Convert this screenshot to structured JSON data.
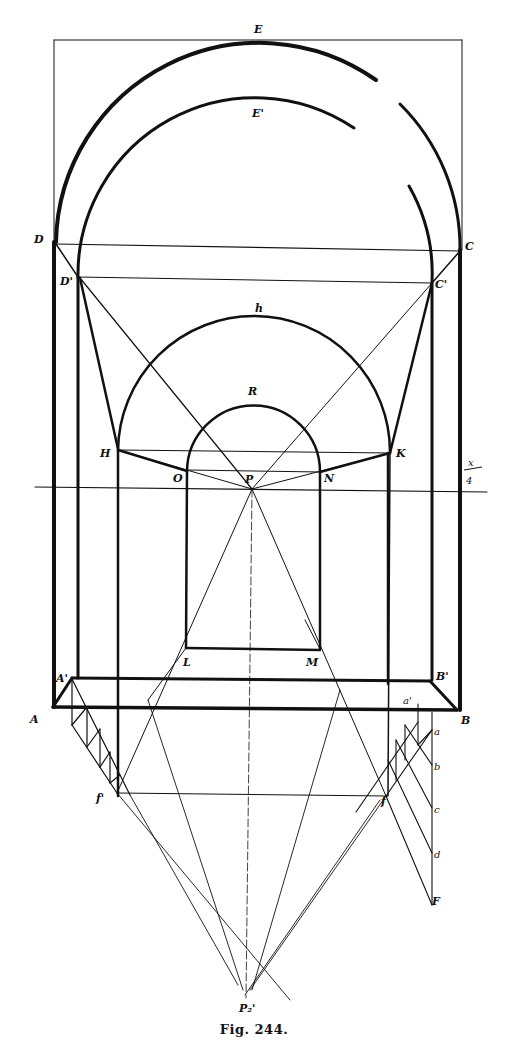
{
  "figure": {
    "caption": "Fig. 244.",
    "stroke_color": "#111111",
    "background": "#ffffff"
  },
  "labels": {
    "E": "E",
    "E_prime": "E'",
    "D": "D",
    "C": "C",
    "D_prime": "D'",
    "C_prime": "C'",
    "h": "h",
    "R": "R",
    "H": "H",
    "K": "K",
    "O": "O",
    "N": "N",
    "P": "P",
    "horizon_mark_top": "x",
    "horizon_mark_bottom": "4",
    "L": "L",
    "M": "M",
    "A_prime": "A'",
    "B_prime": "B'",
    "A": "A",
    "B": "B",
    "a_prime": "a'",
    "a": "a",
    "b": "b",
    "c": "c",
    "d": "d",
    "F": "F",
    "f_prime": "f'",
    "f": "f",
    "P2_prime": "P₂'"
  }
}
